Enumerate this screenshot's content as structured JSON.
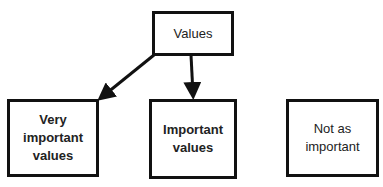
{
  "diagram": {
    "nodes": {
      "root": {
        "label": "Values"
      },
      "very_important": {
        "label": "Very important values"
      },
      "important": {
        "label": "Important values"
      },
      "not_important": {
        "label": "Not as important"
      }
    },
    "edges": [
      {
        "from": "Values",
        "to": "Very important values"
      },
      {
        "from": "Values",
        "to": "Important values"
      }
    ]
  }
}
